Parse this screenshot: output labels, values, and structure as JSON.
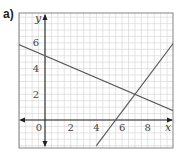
{
  "panel_label": "a)",
  "chart_data": {
    "type": "line",
    "title": "",
    "xlabel": "x",
    "ylabel": "y",
    "xlim": [
      -2.1,
      10
    ],
    "ylim": [
      -2.2,
      8.4
    ],
    "grid": true,
    "x_ticks": [
      0,
      2,
      4,
      6,
      8
    ],
    "x_tick_labels": [
      "0",
      "2",
      "4",
      "6",
      "8"
    ],
    "y_ticks": [
      2,
      4,
      6
    ],
    "y_tick_labels": [
      "2",
      "4",
      "6"
    ],
    "series": [
      {
        "name": "line 1 (decreasing)",
        "equation": "y = 5 - (3/7)x",
        "points": [
          [
            -2.1,
            5.9
          ],
          [
            0,
            5
          ],
          [
            7,
            2
          ],
          [
            10,
            0.71
          ]
        ]
      },
      {
        "name": "line 2 (increasing)",
        "equation": "y = (4/3)x - 22/3",
        "points": [
          [
            4,
            -2
          ],
          [
            5.5,
            0
          ],
          [
            7,
            2
          ],
          [
            10,
            6
          ]
        ]
      }
    ],
    "intersection": [
      7,
      2
    ],
    "colors": {
      "lines": "#555555",
      "grid": "#d8d8d8",
      "axes": "#222222"
    }
  }
}
